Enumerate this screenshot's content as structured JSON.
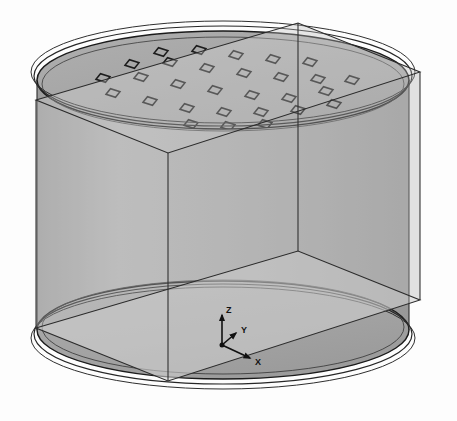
{
  "figure": {
    "kind": "cad-3d-viewport",
    "background_color": "#fdfdfd"
  },
  "colors": {
    "background": "#fdfdfd",
    "cylinder_body": "#a8a8a8",
    "cylinder_body_light": "#b6b6b6",
    "cylinder_body_dark": "#9a9a9a",
    "top_disc": "#a5a5a5",
    "bottom_disc": "#a6a6a6",
    "box_face": "#dcdcdc",
    "box_face_side": "#d4d4d4",
    "edge_line": "#2b2b2b",
    "rim_line": "#1a1a1a",
    "marker_line": "#1c1c1c",
    "axis_line": "#111111"
  },
  "bounding_box": {
    "name": "transparent-bounding-box",
    "opacity": 0.45,
    "vertices": {
      "top_back_left": [
        36,
        100
      ],
      "top_back_right": [
        298,
        23
      ],
      "top_front_right": [
        420,
        72
      ],
      "top_front_left": [
        168,
        153
      ],
      "bottom_back_left": [
        36,
        328
      ],
      "bottom_back_right": [
        298,
        251
      ],
      "bottom_front_right": [
        420,
        300
      ],
      "bottom_front_left": [
        168,
        381
      ]
    }
  },
  "cylinder": {
    "name": "cylinder-body",
    "top_center": [
      223,
      80
    ],
    "bottom_center": [
      223,
      330
    ],
    "radius_x": 193,
    "radius_y": 52,
    "height_px": 250,
    "rim_ring_count": 3,
    "rim_ring_offsets": [
      0,
      4,
      8
    ]
  },
  "top_face_markers": {
    "name": "probe-point-array",
    "shape": "square-outline-projected",
    "count": 29,
    "width_px": 14,
    "height_px": 7,
    "grid_description": "rectangular grid of square probe markers clipped to the circular top face",
    "points": [
      [
        113,
        93
      ],
      [
        150,
        101
      ],
      [
        187,
        108
      ],
      [
        224,
        112
      ],
      [
        141,
        77
      ],
      [
        178,
        84
      ],
      [
        215,
        90
      ],
      [
        252,
        95
      ],
      [
        289,
        98
      ],
      [
        170,
        62
      ],
      [
        207,
        68
      ],
      [
        244,
        73
      ],
      [
        281,
        77
      ],
      [
        318,
        79
      ],
      [
        199,
        50
      ],
      [
        236,
        55
      ],
      [
        273,
        59
      ],
      [
        310,
        62
      ],
      [
        103,
        78
      ],
      [
        132,
        64
      ],
      [
        161,
        52
      ],
      [
        261,
        112
      ],
      [
        298,
        110
      ],
      [
        334,
        104
      ],
      [
        326,
        91
      ],
      [
        352,
        80
      ],
      [
        191,
        124
      ],
      [
        228,
        126
      ],
      [
        265,
        124
      ]
    ]
  },
  "axis_indicator": {
    "name": "coordinate-axis-triad",
    "origin": [
      222,
      345
    ],
    "axes": [
      {
        "label": "Z",
        "dx": 0,
        "dy": -30,
        "label_offset": [
          4,
          -4
        ]
      },
      {
        "label": "X",
        "dx": 28,
        "dy": 13,
        "label_offset": [
          5,
          5
        ]
      },
      {
        "label": "Y",
        "dx": 14,
        "dy": -12,
        "label_offset": [
          5,
          -2
        ]
      }
    ],
    "origin_dot_radius": 2.5
  }
}
